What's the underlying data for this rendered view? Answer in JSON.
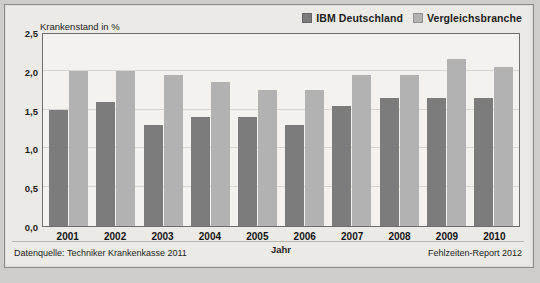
{
  "legend": {
    "items": [
      {
        "label": "IBM Deutschland",
        "color": "#7c7c7c"
      },
      {
        "label": "Vergleichsbranche",
        "color": "#b2b2b2"
      }
    ]
  },
  "axis": {
    "y_title": "Krankenstand in %",
    "x_title": "Jahr"
  },
  "footer": {
    "source": "Datenquelle: Techniker Krankenkasse 2011",
    "report": "Fehlzeiten-Report 2012"
  },
  "chart_data": {
    "type": "bar",
    "title": "",
    "xlabel": "Jahr",
    "ylabel": "Krankenstand in %",
    "ylim": [
      0,
      2.5
    ],
    "yticks": [
      "0,0",
      "0,5",
      "1,0",
      "1,5",
      "2,0",
      "2,5"
    ],
    "ytick_values": [
      0,
      0.5,
      1.0,
      1.5,
      2.0,
      2.5
    ],
    "grid": true,
    "legend_position": "top-right",
    "categories": [
      "2001",
      "2002",
      "2003",
      "2004",
      "2005",
      "2006",
      "2007",
      "2008",
      "2009",
      "2010"
    ],
    "series": [
      {
        "name": "IBM Deutschland",
        "color": "#7c7c7c",
        "values": [
          1.5,
          1.6,
          1.3,
          1.4,
          1.4,
          1.3,
          1.55,
          1.65,
          1.65,
          1.65
        ]
      },
      {
        "name": "Vergleichsbranche",
        "color": "#b2b2b2",
        "values": [
          2.0,
          2.0,
          1.95,
          1.85,
          1.75,
          1.75,
          1.95,
          1.95,
          2.15,
          2.05
        ]
      }
    ]
  }
}
